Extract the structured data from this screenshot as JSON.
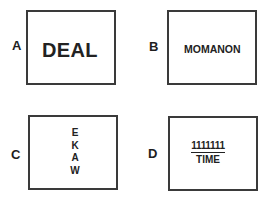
{
  "panels": [
    {
      "label": "A",
      "text": "DEAL"
    },
    {
      "label": "B",
      "text": "MOMANON"
    },
    {
      "label": "C",
      "letters": [
        "E",
        "K",
        "A",
        "W"
      ]
    },
    {
      "label": "D",
      "top": "1111111",
      "bottom": "TIME"
    }
  ],
  "colors": {
    "border": "#3a3a3a",
    "text": "#222222",
    "background": "#ffffff"
  }
}
